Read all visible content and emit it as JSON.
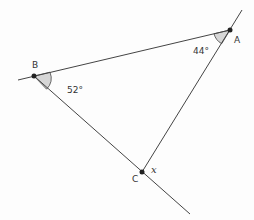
{
  "diagram": {
    "type": "triangle-exterior-angle",
    "points": {
      "A": {
        "label": "A",
        "x": 230,
        "y": 30
      },
      "B": {
        "label": "B",
        "x": 34,
        "y": 76
      },
      "C": {
        "label": "C",
        "x": 142,
        "y": 172
      }
    },
    "angles": {
      "A": {
        "value": "44°"
      },
      "B": {
        "value": "52°"
      },
      "C_exterior": {
        "value": "x"
      }
    },
    "colors": {
      "line": "#444444",
      "shade": "#d6d6d6",
      "point": "#222222"
    }
  }
}
